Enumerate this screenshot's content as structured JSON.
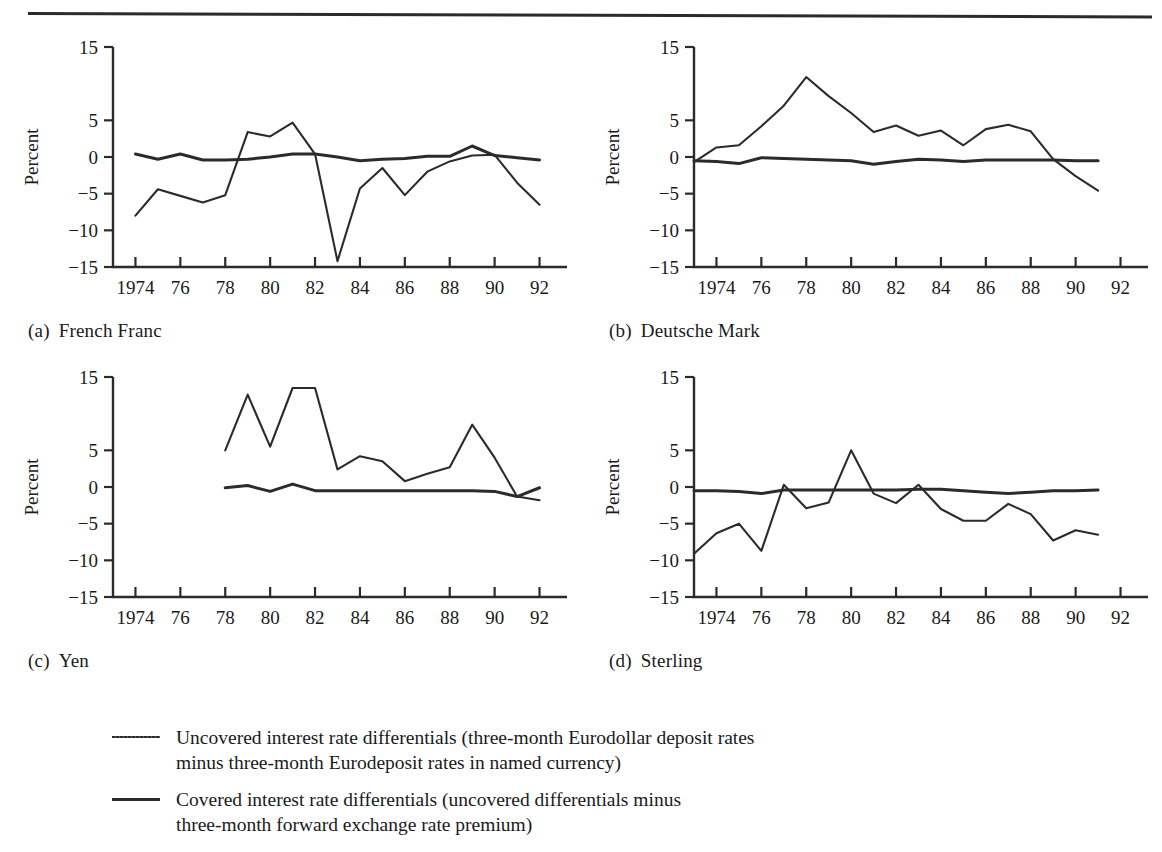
{
  "figure": {
    "y_axis_label": "Percent",
    "y_ticks": [
      "15",
      "5",
      "0",
      "−5",
      "−10",
      "−15"
    ],
    "x_ticks": [
      "1974",
      "76",
      "78",
      "80",
      "82",
      "84",
      "86",
      "88",
      "90",
      "92"
    ],
    "line_color": "#2b2b2b"
  },
  "panels": [
    {
      "index": "(a)",
      "title": "French Franc"
    },
    {
      "index": "(b)",
      "title": "Deutsche Mark"
    },
    {
      "index": "(c)",
      "title": "Yen"
    },
    {
      "index": "(d)",
      "title": "Sterling"
    }
  ],
  "legend": {
    "items": [
      {
        "style": "thin",
        "line1": "Uncovered interest rate differentials (three-month Eurodollar deposit rates",
        "line2": "minus three-month Eurodeposit rates in named currency)"
      },
      {
        "style": "thick",
        "line1": "Covered interest rate differentials (uncovered differentials minus",
        "line2": "three-month forward exchange rate premium)"
      }
    ]
  },
  "chart_data": [
    {
      "type": "line",
      "panel": "(a)",
      "title": "French Franc",
      "xlabel": "",
      "ylabel": "Percent",
      "xlim": [
        1973,
        1992
      ],
      "ylim": [
        -15,
        15
      ],
      "yticks": [
        15,
        5,
        0,
        -5,
        -10,
        -15
      ],
      "xticks": [
        1974,
        1976,
        1978,
        1980,
        1982,
        1984,
        1986,
        1988,
        1990,
        1992
      ],
      "grid": false,
      "legend_position": "below-figure",
      "series": [
        {
          "name": "Uncovered interest rate differentials",
          "style": "thin",
          "x": [
            1974,
            1975,
            1976,
            1977,
            1978,
            1979,
            1980,
            1981,
            1982,
            1983,
            1984,
            1985,
            1986,
            1987,
            1988,
            1989,
            1990,
            1991,
            1992
          ],
          "values": [
            -8.0,
            -4.4,
            -5.3,
            -6.2,
            -5.2,
            3.4,
            2.8,
            4.7,
            0.4,
            -14.2,
            -4.3,
            -1.5,
            -5.2,
            -2.0,
            -0.6,
            0.2,
            0.3,
            -3.5,
            -6.5
          ]
        },
        {
          "name": "Covered interest rate differentials",
          "style": "thick",
          "x": [
            1974,
            1975,
            1976,
            1977,
            1978,
            1979,
            1980,
            1981,
            1982,
            1983,
            1984,
            1985,
            1986,
            1987,
            1988,
            1989,
            1990,
            1991,
            1992
          ],
          "values": [
            0.4,
            -0.3,
            0.4,
            -0.4,
            -0.4,
            -0.3,
            0.0,
            0.4,
            0.4,
            0.0,
            -0.5,
            -0.3,
            -0.2,
            0.1,
            0.1,
            1.5,
            0.2,
            -0.1,
            -0.4
          ]
        }
      ]
    },
    {
      "type": "line",
      "panel": "(b)",
      "title": "Deutsche Mark",
      "xlabel": "",
      "ylabel": "Percent",
      "xlim": [
        1973,
        1992
      ],
      "ylim": [
        -15,
        15
      ],
      "yticks": [
        15,
        5,
        0,
        -5,
        -10,
        -15
      ],
      "xticks": [
        1974,
        1976,
        1978,
        1980,
        1982,
        1984,
        1986,
        1988,
        1990,
        1992
      ],
      "grid": false,
      "legend_position": "below-figure",
      "series": [
        {
          "name": "Uncovered interest rate differentials",
          "style": "thin",
          "x": [
            1973,
            1974,
            1975,
            1976,
            1977,
            1978,
            1979,
            1980,
            1981,
            1982,
            1983,
            1984,
            1985,
            1986,
            1987,
            1988,
            1989,
            1990,
            1991
          ],
          "values": [
            -0.7,
            1.3,
            1.6,
            4.2,
            7.0,
            10.9,
            8.3,
            6.0,
            3.4,
            4.3,
            2.9,
            3.6,
            1.6,
            3.8,
            4.4,
            3.5,
            -0.3,
            -2.6,
            -4.6
          ]
        },
        {
          "name": "Covered interest rate differentials",
          "style": "thick",
          "x": [
            1973,
            1974,
            1975,
            1976,
            1977,
            1978,
            1979,
            1980,
            1981,
            1982,
            1983,
            1984,
            1985,
            1986,
            1987,
            1988,
            1989,
            1990,
            1991
          ],
          "values": [
            -0.5,
            -0.6,
            -0.9,
            -0.1,
            -0.2,
            -0.3,
            -0.4,
            -0.5,
            -1.0,
            -0.6,
            -0.3,
            -0.4,
            -0.6,
            -0.4,
            -0.4,
            -0.4,
            -0.4,
            -0.5,
            -0.5
          ]
        }
      ]
    },
    {
      "type": "line",
      "panel": "(c)",
      "title": "Yen",
      "xlabel": "",
      "ylabel": "Percent",
      "xlim": [
        1973,
        1992
      ],
      "ylim": [
        -15,
        15
      ],
      "yticks": [
        15,
        5,
        0,
        -5,
        -10,
        -15
      ],
      "xticks": [
        1974,
        1976,
        1978,
        1980,
        1982,
        1984,
        1986,
        1988,
        1990,
        1992
      ],
      "grid": false,
      "legend_position": "below-figure",
      "series": [
        {
          "name": "Uncovered interest rate differentials",
          "style": "thin",
          "x": [
            1978,
            1979,
            1980,
            1981,
            1982,
            1983,
            1984,
            1985,
            1986,
            1987,
            1988,
            1989,
            1990,
            1991,
            1992
          ],
          "values": [
            5.0,
            12.6,
            5.5,
            13.5,
            13.5,
            2.4,
            4.2,
            3.5,
            0.8,
            1.8,
            2.7,
            8.5,
            4.0,
            -1.3,
            -1.8
          ]
        },
        {
          "name": "Covered interest rate differentials",
          "style": "thick",
          "x": [
            1978,
            1979,
            1980,
            1981,
            1982,
            1983,
            1984,
            1985,
            1986,
            1987,
            1988,
            1989,
            1990,
            1991,
            1992
          ],
          "values": [
            -0.1,
            0.2,
            -0.6,
            0.4,
            -0.5,
            -0.5,
            -0.5,
            -0.5,
            -0.5,
            -0.5,
            -0.5,
            -0.5,
            -0.6,
            -1.3,
            -0.1
          ]
        }
      ]
    },
    {
      "type": "line",
      "panel": "(d)",
      "title": "Sterling",
      "xlabel": "",
      "ylabel": "Percent",
      "xlim": [
        1973,
        1992
      ],
      "ylim": [
        -15,
        15
      ],
      "yticks": [
        15,
        5,
        0,
        -5,
        -10,
        -15
      ],
      "xticks": [
        1974,
        1976,
        1978,
        1980,
        1982,
        1984,
        1986,
        1988,
        1990,
        1992
      ],
      "grid": false,
      "legend_position": "below-figure",
      "series": [
        {
          "name": "Uncovered interest rate differentials",
          "style": "thin",
          "x": [
            1973,
            1974,
            1975,
            1976,
            1977,
            1978,
            1979,
            1980,
            1981,
            1982,
            1983,
            1984,
            1985,
            1986,
            1987,
            1988,
            1989,
            1990,
            1991
          ],
          "values": [
            -9.1,
            -6.3,
            -5.0,
            -8.7,
            0.3,
            -2.9,
            -2.1,
            5.0,
            -0.9,
            -2.2,
            0.3,
            -3.0,
            -4.6,
            -4.6,
            -2.3,
            -3.7,
            -7.3,
            -5.9,
            -6.5
          ]
        },
        {
          "name": "Covered interest rate differentials",
          "style": "thick",
          "x": [
            1973,
            1974,
            1975,
            1976,
            1977,
            1978,
            1979,
            1980,
            1981,
            1982,
            1983,
            1984,
            1985,
            1986,
            1987,
            1988,
            1989,
            1990,
            1991
          ],
          "values": [
            -0.5,
            -0.5,
            -0.6,
            -0.9,
            -0.4,
            -0.4,
            -0.4,
            -0.4,
            -0.4,
            -0.4,
            -0.3,
            -0.3,
            -0.5,
            -0.7,
            -0.9,
            -0.7,
            -0.5,
            -0.5,
            -0.4
          ]
        }
      ]
    }
  ]
}
